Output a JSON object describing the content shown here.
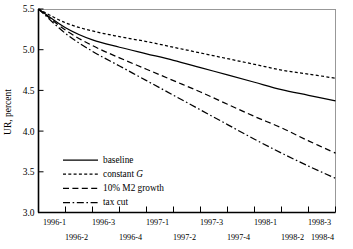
{
  "figure": {
    "name": "unemployment-rate-forecast-chart"
  },
  "chart_data": {
    "type": "line",
    "title": "",
    "xlabel": "",
    "ylabel": "UR, percent",
    "ylim": [
      3.0,
      5.5
    ],
    "yticks": [
      "3.0",
      "3.5",
      "4.0",
      "4.5",
      "5.0",
      "5.5"
    ],
    "ytick_values": [
      3.0,
      3.5,
      4.0,
      4.5,
      5.0,
      5.5
    ],
    "grid": false,
    "legend_position": "lower-left-inside",
    "categories": [
      "1996-1",
      "1996-2",
      "1996-3",
      "1996-4",
      "1997-1",
      "1997-2",
      "1997-3",
      "1997-4",
      "1998-1",
      "1998-2",
      "1998-3",
      "1998-4"
    ],
    "xtick_labels_row_top": [
      "1996-1",
      "1996-3",
      "1997-1",
      "1997-3",
      "1998-1",
      "1998-3"
    ],
    "xtick_labels_row_bottom": [
      "1996-2",
      "1996-4",
      "1997-2",
      "1997-4",
      "1998-2",
      "1998-4"
    ],
    "series": [
      {
        "name": "baseline",
        "style": "solid",
        "values": [
          5.5,
          5.27,
          5.12,
          5.03,
          4.95,
          4.87,
          4.78,
          4.69,
          4.6,
          4.51,
          4.44,
          4.37
        ]
      },
      {
        "name": "constant G",
        "style": "dotted",
        "values": [
          5.5,
          5.33,
          5.23,
          5.16,
          5.1,
          5.03,
          4.96,
          4.89,
          4.82,
          4.75,
          4.7,
          4.65
        ]
      },
      {
        "name": "10% M2 growth",
        "style": "dashed",
        "values": [
          5.5,
          5.24,
          5.05,
          4.9,
          4.76,
          4.62,
          4.48,
          4.33,
          4.18,
          4.04,
          3.88,
          3.73
        ]
      },
      {
        "name": "tax cut",
        "style": "dashdot",
        "values": [
          5.5,
          5.2,
          4.98,
          4.8,
          4.62,
          4.44,
          4.26,
          4.08,
          3.9,
          3.73,
          3.57,
          3.42
        ]
      }
    ]
  },
  "legend": {
    "entries": [
      {
        "label": "baseline",
        "label_suffix": "",
        "style": "solid"
      },
      {
        "label": "constant ",
        "label_suffix": "G",
        "style": "dotted"
      },
      {
        "label": "10% M2 growth",
        "label_suffix": "",
        "style": "dashed"
      },
      {
        "label": "tax cut",
        "label_suffix": "",
        "style": "dashdot"
      }
    ]
  },
  "colors": {
    "ink": "#000000",
    "frame": "#8c8c8c",
    "background": "#ffffff"
  }
}
